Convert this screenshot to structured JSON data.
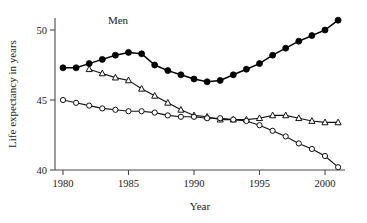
{
  "figure": {
    "background": "#ffffff",
    "ink_color": "#111111",
    "axis_color": "#4a4a4a"
  },
  "chart_data": {
    "type": "line",
    "title": "",
    "subtitle": "",
    "xlabel": "Year",
    "ylabel": "Life expectancy in years",
    "xlim": [
      1979.3,
      2001.8
    ],
    "ylim": [
      39.3,
      51.2
    ],
    "xticks": [
      1980,
      1985,
      1990,
      1995,
      2000
    ],
    "xticklabels": [
      "1980",
      "1985",
      "1990",
      "1995",
      "2000"
    ],
    "yticks": [
      40,
      45,
      50
    ],
    "yticklabels": [
      "40",
      "45",
      "50"
    ],
    "grid": false,
    "legend": "none",
    "annotations": [
      {
        "text": "Men",
        "x": 1984.2,
        "y": 50.4
      }
    ],
    "x": [
      1980,
      1981,
      1982,
      1983,
      1984,
      1985,
      1986,
      1987,
      1988,
      1989,
      1990,
      1991,
      1992,
      1993,
      1994,
      1995,
      1996,
      1997,
      1998,
      1999,
      2000,
      2001
    ],
    "series": [
      {
        "name": "Men",
        "marker": "filled-circle",
        "values": [
          47.3,
          47.3,
          47.6,
          47.9,
          48.2,
          48.4,
          48.3,
          47.5,
          47.1,
          46.8,
          46.5,
          46.3,
          46.4,
          46.8,
          47.2,
          47.6,
          48.2,
          48.7,
          49.2,
          49.6,
          50.0,
          50.7
        ]
      },
      {
        "name": "Series-triangle",
        "marker": "open-triangle",
        "x": [
          1982,
          1983,
          1984,
          1985,
          1986,
          1987,
          1988,
          1989,
          1990,
          1991,
          1992,
          1993,
          1994,
          1995,
          1996,
          1997,
          1998,
          1999,
          2000,
          2001
        ],
        "values": [
          47.2,
          46.9,
          46.6,
          46.4,
          45.8,
          45.3,
          44.8,
          44.3,
          43.9,
          43.8,
          43.6,
          43.6,
          43.6,
          43.7,
          43.9,
          43.9,
          43.7,
          43.5,
          43.4,
          43.4
        ]
      },
      {
        "name": "Series-circle",
        "marker": "open-circle",
        "x": [
          1980,
          1981,
          1982,
          1983,
          1984,
          1985,
          1986,
          1987,
          1988,
          1989,
          1990,
          1991,
          1992,
          1993,
          1994,
          1995,
          1996,
          1997,
          1998,
          1999,
          2000,
          2001
        ],
        "values": [
          45.0,
          44.8,
          44.6,
          44.4,
          44.3,
          44.2,
          44.2,
          44.1,
          43.9,
          43.8,
          43.8,
          43.7,
          43.7,
          43.6,
          43.5,
          43.2,
          42.8,
          42.4,
          41.9,
          41.5,
          41.0,
          40.2
        ]
      }
    ]
  }
}
